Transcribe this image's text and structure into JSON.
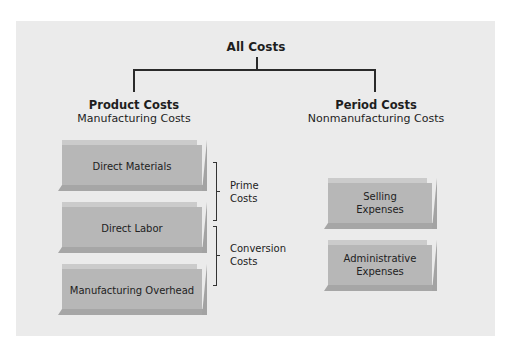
{
  "diagram": {
    "root": {
      "label": "All Costs"
    },
    "branches": [
      {
        "title": "Product Costs",
        "subtitle": "Manufacturing Costs",
        "items": [
          {
            "label": "Direct Materials"
          },
          {
            "label": "Direct Labor"
          },
          {
            "label": "Manufacturing Overhead"
          }
        ],
        "groupings": [
          {
            "label_line1": "Prime",
            "label_line2": "Costs",
            "spans": [
              "Direct Materials",
              "Direct Labor"
            ]
          },
          {
            "label_line1": "Conversion",
            "label_line2": "Costs",
            "spans": [
              "Direct Labor",
              "Manufacturing Overhead"
            ]
          }
        ]
      },
      {
        "title": "Period Costs",
        "subtitle": "Nonmanufacturing Costs",
        "items": [
          {
            "label_line1": "Selling",
            "label_line2": "Expenses"
          },
          {
            "label_line1": "Administrative",
            "label_line2": "Expenses"
          }
        ]
      }
    ]
  },
  "colors": {
    "panel": "#ebebeb",
    "box_face": "#b7b7b7",
    "lines": "#2a2a2a"
  }
}
